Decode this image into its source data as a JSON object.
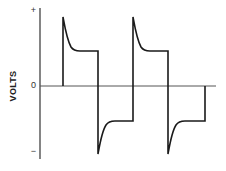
{
  "figure": {
    "type": "voltage-waveform",
    "y_axis": {
      "label": "VOLTS",
      "ticks": [
        {
          "label": "+",
          "y": 12
        },
        {
          "label": "0",
          "y": 86
        },
        {
          "label": "−",
          "y": 153
        }
      ]
    },
    "colors": {
      "trace": "#1a1a1a",
      "axis": "#333333",
      "baseline": "#555555",
      "background": "#ffffff"
    },
    "waveform": {
      "description": "Bipolar square wave with overshoot spike at each transition decaying to a flat plateau",
      "cycles": 2,
      "levels": [
        "+peak",
        "+plateau",
        "0",
        "-plateau",
        "-peak"
      ]
    }
  }
}
